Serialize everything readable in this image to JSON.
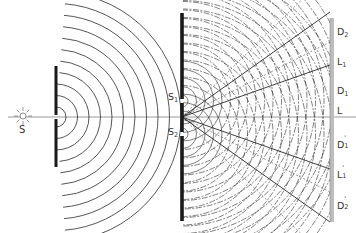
{
  "diagram": {
    "colors": {
      "background": "#ffffff",
      "barrier": "#1a1a1a",
      "wave": "#2a2a2a",
      "screen": "#bdbdbd",
      "axis": "#555555",
      "label": "#333333"
    },
    "source": {
      "label": "S",
      "x": 23,
      "y": 116
    },
    "barrier1": {
      "x": 56,
      "top": 66,
      "bottom": 167,
      "gap_y": 117
    },
    "barrier2": {
      "x": 182,
      "top": 13,
      "bottom": 221
    },
    "slits": [
      {
        "label": "S",
        "sub": "1",
        "x": 182,
        "y": 101
      },
      {
        "label": "S",
        "sub": "2",
        "x": 182,
        "y": 134
      }
    ],
    "screen": {
      "x": 330,
      "top": 18,
      "bottom": 222
    },
    "screen_labels": [
      {
        "base": "D",
        "sub": "2",
        "prime": "",
        "y": 34
      },
      {
        "base": "L",
        "sub": "1",
        "prime": "",
        "y": 64
      },
      {
        "base": "D",
        "sub": "1",
        "prime": "",
        "y": 93
      },
      {
        "base": "L",
        "sub": "",
        "prime": "",
        "y": 113
      },
      {
        "base": "D",
        "sub": "1",
        "prime": "'",
        "y": 145
      },
      {
        "base": "L",
        "sub": "1",
        "prime": "'",
        "y": 175
      },
      {
        "base": "D",
        "sub": "2",
        "prime": "'",
        "y": 206
      }
    ]
  }
}
